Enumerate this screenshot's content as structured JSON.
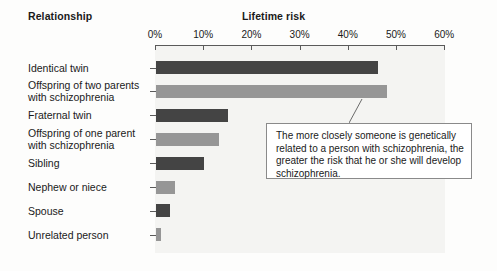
{
  "headers": {
    "relationship": "Relationship",
    "lifetime_risk": "Lifetime risk"
  },
  "callout": {
    "text": "The more closely someone is genetically related to a person with schizophrenia, the greater the risk that he or she will develop schizophrenia."
  },
  "chart_data": {
    "type": "bar",
    "orientation": "horizontal",
    "title": "Lifetime risk",
    "xlabel": "Lifetime risk",
    "ylabel": "Relationship",
    "xlim": [
      0,
      60
    ],
    "grid": false,
    "legend": null,
    "tick_labels": [
      "0%",
      "10%",
      "20%",
      "30%",
      "40%",
      "50%",
      "60%"
    ],
    "tick_values": [
      0,
      10,
      20,
      30,
      40,
      50,
      60
    ],
    "colors": {
      "dark": "#444444",
      "light": "#969696"
    },
    "categories": [
      "Identical twin",
      "Offspring of two parents\nwith schizophrenia",
      "Fraternal twin",
      "Offspring of one parent\nwith schizophrenia",
      "Sibling",
      "Nephew or niece",
      "Spouse",
      "Unrelated person"
    ],
    "values": [
      46,
      48,
      15,
      13,
      10,
      4,
      3,
      1
    ],
    "shades": [
      "dark",
      "light",
      "dark",
      "light",
      "dark",
      "light",
      "dark",
      "light"
    ]
  }
}
